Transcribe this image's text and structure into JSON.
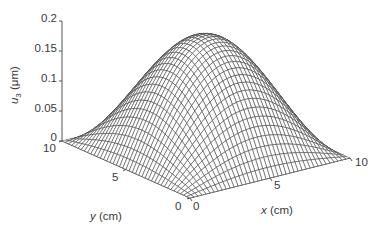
{
  "chart_data": {
    "type": "surface",
    "title": "",
    "xlabel": "x (cm)",
    "ylabel": "y (cm)",
    "zlabel": "u3 (μm)",
    "xlim": [
      0,
      10
    ],
    "ylim": [
      0,
      10
    ],
    "zlim": [
      0,
      0.2
    ],
    "xticks": [
      "0",
      "5",
      "10"
    ],
    "yticks": [
      "0",
      "5",
      "10"
    ],
    "zticks": [
      "0",
      "0.05",
      "0.1",
      "0.15",
      "0.2"
    ],
    "grid": false,
    "mesh_lines": 40,
    "peak": {
      "x": 5,
      "y": 5,
      "z": 0.19
    },
    "shape": "z = 0.19 * sin(pi*x/10) * sin(pi*y/10)",
    "x": [
      0,
      1,
      2,
      3,
      4,
      5,
      6,
      7,
      8,
      9,
      10
    ],
    "y": [
      0,
      1,
      2,
      3,
      4,
      5,
      6,
      7,
      8,
      9,
      10
    ],
    "z": [
      [
        0,
        0,
        0,
        0,
        0,
        0,
        0,
        0,
        0,
        0,
        0
      ],
      [
        0,
        0.018,
        0.035,
        0.047,
        0.056,
        0.059,
        0.056,
        0.047,
        0.035,
        0.018,
        0
      ],
      [
        0,
        0.035,
        0.066,
        0.09,
        0.106,
        0.112,
        0.106,
        0.09,
        0.066,
        0.035,
        0
      ],
      [
        0,
        0.047,
        0.09,
        0.124,
        0.146,
        0.154,
        0.146,
        0.124,
        0.09,
        0.047,
        0
      ],
      [
        0,
        0.056,
        0.106,
        0.146,
        0.172,
        0.181,
        0.172,
        0.146,
        0.106,
        0.056,
        0
      ],
      [
        0,
        0.059,
        0.112,
        0.154,
        0.181,
        0.19,
        0.181,
        0.154,
        0.112,
        0.059,
        0
      ],
      [
        0,
        0.056,
        0.106,
        0.146,
        0.172,
        0.181,
        0.172,
        0.146,
        0.106,
        0.056,
        0
      ],
      [
        0,
        0.047,
        0.09,
        0.124,
        0.146,
        0.154,
        0.146,
        0.124,
        0.09,
        0.047,
        0
      ],
      [
        0,
        0.035,
        0.066,
        0.09,
        0.106,
        0.112,
        0.106,
        0.09,
        0.066,
        0.035,
        0
      ],
      [
        0,
        0.018,
        0.035,
        0.047,
        0.056,
        0.059,
        0.056,
        0.047,
        0.035,
        0.018,
        0
      ],
      [
        0,
        0,
        0,
        0,
        0,
        0,
        0,
        0,
        0,
        0,
        0
      ]
    ],
    "colors": {
      "mesh": "#3c3c3c",
      "face": "#ffffff",
      "axis": "#555555"
    }
  },
  "labels": {
    "z_symbol": "u",
    "z_sub": "3",
    "z_unit": " (μm)",
    "x_symbol": "x",
    "x_unit": " (cm)",
    "y_symbol": "y",
    "y_unit": " (cm)"
  }
}
